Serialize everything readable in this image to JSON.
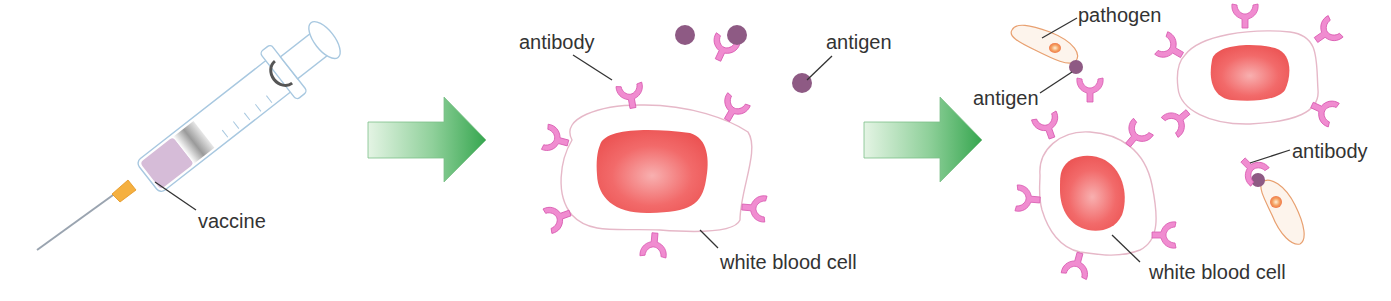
{
  "diagram": {
    "colors": {
      "antibody": "#f08cd0",
      "antibody_stroke": "#d85ab0",
      "antigen": "#8e5a84",
      "nucleus": "#f06060",
      "cell_outline": "#e6b8c8",
      "arrow_light": "#dff2df",
      "arrow_dark": "#3eaa55",
      "pathogen_stroke": "#e8a070",
      "syringe_stroke": "#a8c8e0",
      "vaccine_fill": "#d8c0dc",
      "needle_hub": "#f5b040",
      "label_text": "#333333",
      "leader_line": "#333333"
    },
    "stages": [
      {
        "id": "stage-1",
        "labels": {
          "vaccine": "vaccine"
        }
      },
      {
        "id": "stage-2",
        "labels": {
          "antibody": "antibody",
          "antigen": "antigen",
          "white_blood_cell": "white blood cell"
        }
      },
      {
        "id": "stage-3",
        "labels": {
          "pathogen": "pathogen",
          "antigen": "antigen",
          "antibody": "antibody",
          "white_blood_cell": "white blood cell"
        }
      }
    ]
  }
}
